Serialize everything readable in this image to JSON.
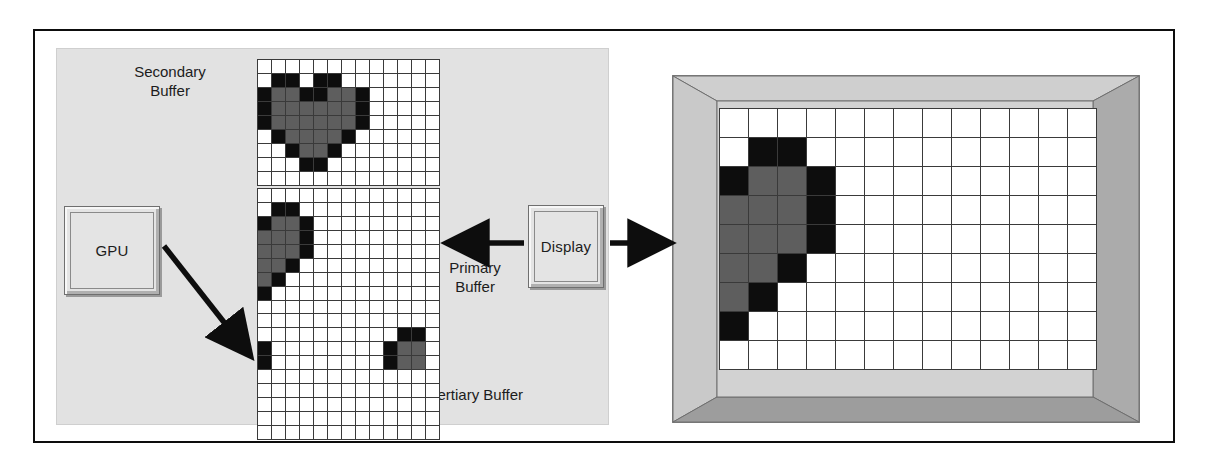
{
  "diagram": {
    "panel_label": "gpu-memory-panel"
  },
  "boxes": {
    "gpu": {
      "label": "GPU"
    },
    "display": {
      "label": "Display"
    }
  },
  "labels": {
    "secondary_buffer": "Secondary\nBuffer",
    "primary_buffer": "Primary\nBuffer",
    "tertiary_buffer": "Tertiary Buffer"
  },
  "colors": {
    "panel_background": "#e2e2e2",
    "grid_line": "#3a3a3a",
    "pixel_empty": "#ffffff",
    "pixel_mid": "#5e5e5e",
    "pixel_dark": "#0d0d0d",
    "bezel_light": "#d6d6d6",
    "bezel_dark": "#a7a7a7",
    "outline": "#0d0d0d"
  },
  "arrows": [
    {
      "name": "gpu-to-tertiary-buffer",
      "direction": "down-right",
      "from": "GPU",
      "to": "Tertiary Buffer"
    },
    {
      "name": "primary-buffer-to-display",
      "direction": "left",
      "from": "Display",
      "to": "Primary Buffer"
    },
    {
      "name": "display-to-monitor",
      "direction": "right",
      "from": "Display",
      "to": "Monitor"
    }
  ],
  "grids": {
    "cell_size": 14,
    "secondary": {
      "name": "secondary-buffer-grid",
      "cols": 13,
      "rows": 9,
      "pixels": [
        [
          0,
          0,
          0,
          0,
          0,
          0,
          0,
          0,
          0,
          0,
          0,
          0,
          0
        ],
        [
          0,
          2,
          2,
          0,
          2,
          2,
          0,
          0,
          0,
          0,
          0,
          0,
          0
        ],
        [
          2,
          1,
          1,
          2,
          2,
          1,
          1,
          2,
          0,
          0,
          0,
          0,
          0
        ],
        [
          2,
          1,
          1,
          1,
          1,
          1,
          1,
          2,
          0,
          0,
          0,
          0,
          0
        ],
        [
          2,
          1,
          1,
          1,
          1,
          1,
          1,
          2,
          0,
          0,
          0,
          0,
          0
        ],
        [
          0,
          2,
          1,
          1,
          1,
          1,
          2,
          0,
          0,
          0,
          0,
          0,
          0
        ],
        [
          0,
          0,
          2,
          1,
          1,
          2,
          0,
          0,
          0,
          0,
          0,
          0,
          0
        ],
        [
          0,
          0,
          0,
          2,
          2,
          0,
          0,
          0,
          0,
          0,
          0,
          0,
          0
        ],
        [
          0,
          0,
          0,
          0,
          0,
          0,
          0,
          0,
          0,
          0,
          0,
          0,
          0
        ]
      ]
    },
    "primary": {
      "name": "primary-buffer-grid",
      "cols": 13,
      "rows": 9,
      "pixels": [
        [
          0,
          0,
          0,
          0,
          0,
          0,
          0,
          0,
          0,
          0,
          0,
          0,
          0
        ],
        [
          0,
          2,
          2,
          0,
          0,
          0,
          0,
          0,
          0,
          0,
          0,
          0,
          0
        ],
        [
          2,
          1,
          1,
          2,
          0,
          0,
          0,
          0,
          0,
          0,
          0,
          0,
          0
        ],
        [
          1,
          1,
          1,
          2,
          0,
          0,
          0,
          0,
          0,
          0,
          0,
          0,
          0
        ],
        [
          1,
          1,
          1,
          2,
          0,
          0,
          0,
          0,
          0,
          0,
          0,
          0,
          0
        ],
        [
          1,
          1,
          2,
          0,
          0,
          0,
          0,
          0,
          0,
          0,
          0,
          0,
          0
        ],
        [
          1,
          2,
          0,
          0,
          0,
          0,
          0,
          0,
          0,
          0,
          0,
          0,
          0
        ],
        [
          2,
          0,
          0,
          0,
          0,
          0,
          0,
          0,
          0,
          0,
          0,
          0,
          0
        ],
        [
          0,
          0,
          0,
          0,
          0,
          0,
          0,
          0,
          0,
          0,
          0,
          0,
          0
        ]
      ]
    },
    "tertiary": {
      "name": "tertiary-buffer-grid",
      "cols": 13,
      "rows": 9,
      "pixels": [
        [
          0,
          0,
          0,
          0,
          0,
          0,
          0,
          0,
          0,
          0,
          0,
          0,
          0
        ],
        [
          0,
          0,
          0,
          0,
          0,
          0,
          0,
          0,
          0,
          0,
          2,
          2,
          0
        ],
        [
          2,
          0,
          0,
          0,
          0,
          0,
          0,
          0,
          0,
          2,
          1,
          1,
          0
        ],
        [
          2,
          0,
          0,
          0,
          0,
          0,
          0,
          0,
          0,
          2,
          1,
          1,
          0
        ],
        [
          0,
          0,
          0,
          0,
          0,
          0,
          0,
          0,
          0,
          0,
          0,
          0,
          0
        ],
        [
          0,
          0,
          0,
          0,
          0,
          0,
          0,
          0,
          0,
          0,
          0,
          0,
          0
        ],
        [
          0,
          0,
          0,
          0,
          0,
          0,
          0,
          0,
          0,
          0,
          0,
          0,
          0
        ],
        [
          0,
          0,
          0,
          0,
          0,
          0,
          0,
          0,
          0,
          0,
          0,
          0,
          0
        ],
        [
          0,
          0,
          0,
          0,
          0,
          0,
          0,
          0,
          0,
          0,
          0,
          0,
          0
        ]
      ]
    },
    "monitor": {
      "name": "monitor-screen-grid",
      "cols": 13,
      "rows": 9,
      "cell_size": 29,
      "pixels": [
        [
          0,
          0,
          0,
          0,
          0,
          0,
          0,
          0,
          0,
          0,
          0,
          0,
          0
        ],
        [
          0,
          2,
          2,
          0,
          0,
          0,
          0,
          0,
          0,
          0,
          0,
          0,
          0
        ],
        [
          2,
          1,
          1,
          2,
          0,
          0,
          0,
          0,
          0,
          0,
          0,
          0,
          0
        ],
        [
          1,
          1,
          1,
          2,
          0,
          0,
          0,
          0,
          0,
          0,
          0,
          0,
          0
        ],
        [
          1,
          1,
          1,
          2,
          0,
          0,
          0,
          0,
          0,
          0,
          0,
          0,
          0
        ],
        [
          1,
          1,
          2,
          0,
          0,
          0,
          0,
          0,
          0,
          0,
          0,
          0,
          0
        ],
        [
          1,
          2,
          0,
          0,
          0,
          0,
          0,
          0,
          0,
          0,
          0,
          0,
          0
        ],
        [
          2,
          0,
          0,
          0,
          0,
          0,
          0,
          0,
          0,
          0,
          0,
          0,
          0
        ],
        [
          0,
          0,
          0,
          0,
          0,
          0,
          0,
          0,
          0,
          0,
          0,
          0,
          0
        ]
      ]
    }
  }
}
